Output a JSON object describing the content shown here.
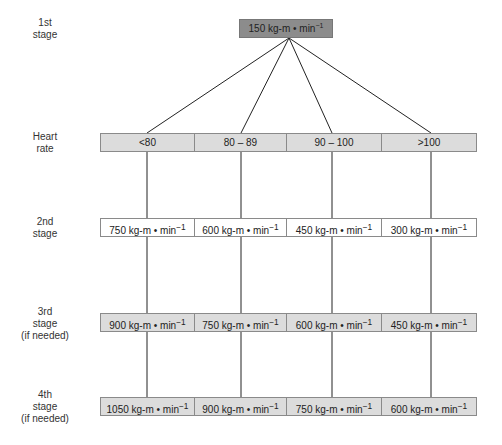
{
  "unit": "kg-m • min",
  "unit_exponent": "−1",
  "colors": {
    "top_box": "#8c8c8c",
    "grey_row": "#dcdcdc",
    "white_row": "#ffffff",
    "line": "#222222",
    "border": "#8a8a8a"
  },
  "stages": [
    {
      "id": "stage1",
      "label_lines": [
        "1st",
        "stage"
      ]
    },
    {
      "id": "heart_rate",
      "label_lines": [
        "Heart",
        "rate"
      ]
    },
    {
      "id": "stage2",
      "label_lines": [
        "2nd",
        "stage"
      ]
    },
    {
      "id": "stage3",
      "label_lines": [
        "3rd",
        "stage",
        "(if needed)"
      ]
    },
    {
      "id": "stage4",
      "label_lines": [
        "4th",
        "stage",
        "(if needed)"
      ]
    }
  ],
  "first_stage": {
    "value": "150"
  },
  "heart_rate": {
    "cells": [
      "<80",
      "80 – 89",
      "90 – 100",
      ">100"
    ]
  },
  "second_stage": {
    "cells": [
      "750",
      "600",
      "450",
      "300"
    ]
  },
  "third_stage": {
    "cells": [
      "900",
      "750",
      "600",
      "450"
    ]
  },
  "fourth_stage": {
    "cells": [
      "1050",
      "900",
      "750",
      "600"
    ]
  }
}
